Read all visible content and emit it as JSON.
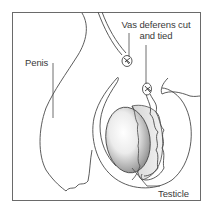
{
  "diagram": {
    "labels": {
      "penis": "Penis",
      "vas_deferens_line1": "Vas deferens cut",
      "vas_deferens_line2": "and tied",
      "testicle": "Testicle"
    },
    "colors": {
      "stroke": "#4a4a4a",
      "frame": "#6a6a6a",
      "background": "#ffffff",
      "testicle_shade_dark": "#8a8a8a",
      "testicle_shade_light": "#f4f4f4"
    }
  }
}
